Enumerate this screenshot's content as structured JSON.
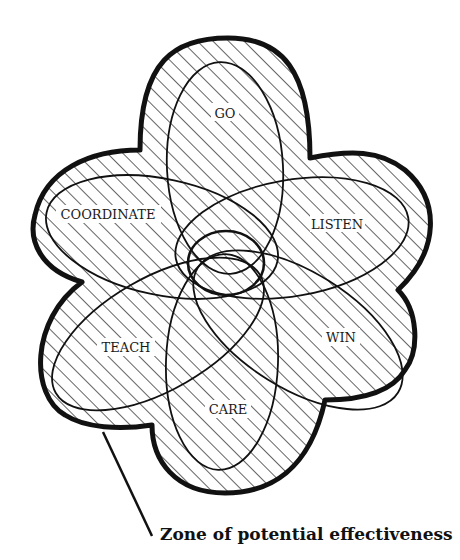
{
  "diagram": {
    "type": "overlapping-ellipses-flower",
    "colors": {
      "ink": "#111111",
      "background": "#ffffff"
    },
    "labels": {
      "go": "GO",
      "coordinate": "COORDINATE",
      "listen": "LISTEN",
      "teach": "TEACH",
      "win": "WIN",
      "care": "CARE"
    },
    "caption": "Zone of potential effectiveness"
  }
}
